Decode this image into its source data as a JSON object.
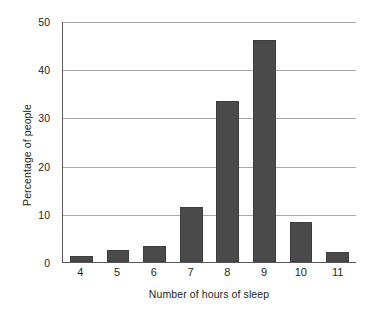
{
  "chart_data": {
    "type": "bar",
    "title": "",
    "subtitle": "",
    "xlabel": "Number of hours of sleep",
    "ylabel": "Percentage of people",
    "categories": [
      "4",
      "5",
      "6",
      "7",
      "8",
      "9",
      "10",
      "11"
    ],
    "values": [
      1.2,
      2.5,
      3.4,
      11.5,
      33.5,
      46,
      8.3,
      2
    ],
    "series": [
      {
        "name": "Percentage of people",
        "values": [
          1.2,
          2.5,
          3.4,
          11.5,
          33.5,
          46,
          8.3,
          2
        ]
      }
    ],
    "ylim": [
      0,
      50
    ],
    "yticks": [
      0,
      10,
      20,
      30,
      40,
      50
    ],
    "ytick_labels": [
      "0",
      "10",
      "20",
      "30",
      "40",
      "50"
    ],
    "xtick_labels": [
      "4",
      "5",
      "6",
      "7",
      "8",
      "9",
      "10",
      "11"
    ],
    "grid": "horizontal",
    "legend": "none",
    "annotations": [],
    "colors": {
      "bar": "#4a4a4a",
      "gridline": "#a7a9ac",
      "axis": "#58595b",
      "text": "#231f20",
      "background": "#ffffff"
    }
  }
}
